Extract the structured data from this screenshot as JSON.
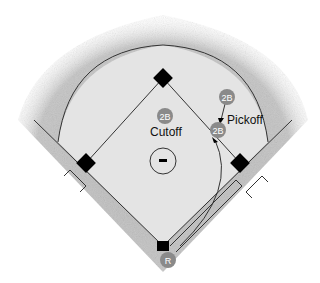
{
  "diagram": {
    "labels": {
      "cutoff": "Cutoff",
      "pickoff": "Pickoff"
    },
    "players": [
      {
        "id": "2b-cutoff",
        "label": "2B",
        "role": "cutoff"
      },
      {
        "id": "2b-start",
        "label": "2B",
        "role": "pickoff-start"
      },
      {
        "id": "2b-pickoff",
        "label": "2B",
        "role": "pickoff"
      },
      {
        "id": "runner",
        "label": "R",
        "role": "runner"
      }
    ],
    "pitcher_symbol": "-",
    "colors": {
      "grass": "#bdbdbd",
      "infield": "#e6e6e6",
      "lines": "#333333",
      "bases": "#000000",
      "badge": "#8a8a8a"
    }
  }
}
